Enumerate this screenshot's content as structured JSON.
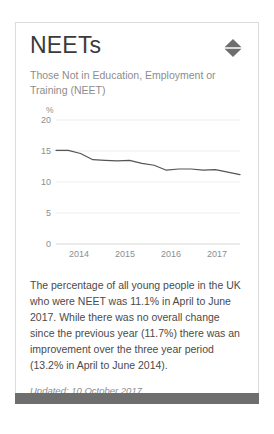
{
  "card": {
    "title": "NEETs",
    "subtitle": "Those Not in Education, Employment or Training (NEET)",
    "toggle_icon": "expand-collapse-diamond-icon",
    "body_text": "The percentage of all young people in the UK who were NEET was 11.1% in April to June 2017. While there was no overall change since the previous year (11.7%) there was an improvement over the three year period (13.2% in April to June 2014).",
    "updated": "Updated: 10 October 2017",
    "accent_color": "#6e6e6e",
    "line_color": "#555555",
    "border_color": "#dcdcdc"
  },
  "chart_data": {
    "type": "line",
    "title": "",
    "xlabel": "",
    "ylabel": "%",
    "ylim": [
      0,
      20
    ],
    "yticks": [
      0,
      5,
      10,
      15,
      20
    ],
    "xticks": [
      "2014",
      "2015",
      "2016",
      "2017"
    ],
    "grid": true,
    "legend": "none",
    "x": [
      "2013 Q3",
      "2013 Q4",
      "2014 Q1",
      "2014 Q2",
      "2014 Q3",
      "2014 Q4",
      "2015 Q1",
      "2015 Q2",
      "2015 Q3",
      "2015 Q4",
      "2016 Q1",
      "2016 Q2",
      "2016 Q3",
      "2016 Q4",
      "2017 Q1",
      "2017 Q2"
    ],
    "series": [
      {
        "name": "NEET rate",
        "values": [
          15.1,
          15.1,
          14.6,
          13.6,
          13.5,
          13.4,
          13.5,
          13.0,
          12.7,
          11.9,
          12.1,
          12.1,
          11.9,
          12.0,
          11.6,
          11.2
        ]
      }
    ]
  }
}
